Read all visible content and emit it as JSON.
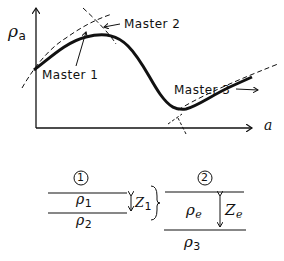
{
  "diagram": {
    "y_axis_label": "ρ",
    "y_axis_sub": "a",
    "x_axis_label": "a",
    "curve_labels": [
      "Master 1",
      "Master 2",
      "Master 3"
    ],
    "case1": {
      "number": "1",
      "top_layer": "ρ",
      "top_layer_sub": "1",
      "bottom_layer": "ρ",
      "bottom_layer_sub": "2",
      "thickness": "Z",
      "thickness_sub": "1"
    },
    "case2": {
      "number": "2",
      "top_layer": "ρ",
      "top_layer_sub": "e",
      "bottom_layer": "ρ",
      "bottom_layer_sub": "3",
      "thickness": "Z",
      "thickness_sub": "e"
    }
  }
}
